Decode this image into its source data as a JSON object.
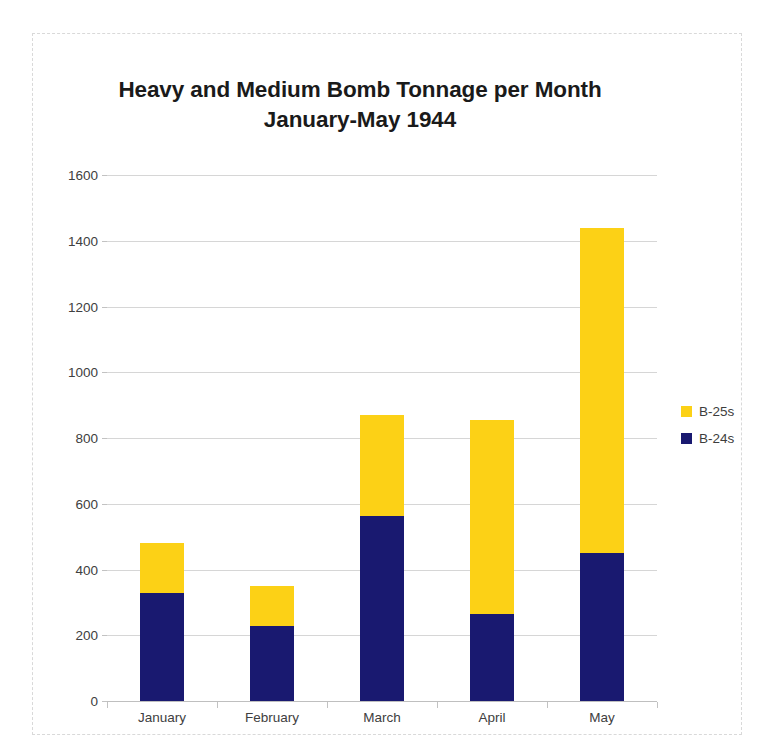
{
  "chart_data": {
    "type": "bar",
    "stacked": true,
    "title": "Heavy and Medium Bomb Tonnage per Month January-May 1944",
    "title_lines": [
      "Heavy and Medium Bomb Tonnage per Month",
      "January-May 1944"
    ],
    "categories": [
      "January",
      "February",
      "March",
      "April",
      "May"
    ],
    "series": [
      {
        "name": "B-24s",
        "color": "#191970",
        "values": [
          330,
          228,
          562,
          265,
          450
        ]
      },
      {
        "name": "B-25s",
        "color": "#FCD116",
        "values": [
          150,
          122,
          308,
          590,
          988
        ]
      }
    ],
    "totals": [
      480,
      350,
      870,
      855,
      1438
    ],
    "xlabel": "",
    "ylabel": "",
    "ylim": [
      0,
      1600
    ],
    "ytick_step": 200,
    "yticks": [
      0,
      200,
      400,
      600,
      800,
      1000,
      1200,
      1400,
      1600
    ],
    "ytick_labels": [
      "0",
      "200",
      "400",
      "600",
      "800",
      "1000",
      "1200",
      "1400",
      "1600"
    ],
    "grid": true,
    "legend_position": "right",
    "legend_order": [
      "B-25s",
      "B-24s"
    ],
    "colors": {
      "b25s": "#FCD116",
      "b24s": "#191970",
      "gridline": "#d6d6d6",
      "axis": "#bfbfbf",
      "text": "#404040",
      "title": "#1a1a1a",
      "frame_border": "#d9d9d9",
      "background": "#ffffff"
    }
  }
}
